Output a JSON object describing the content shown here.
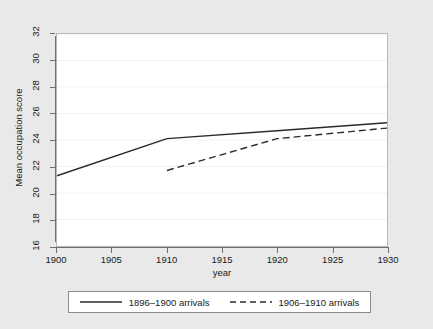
{
  "chart_data": {
    "type": "line",
    "title": "",
    "xlabel": "year",
    "ylabel": "Mean occupation score",
    "xlim": [
      1900,
      1930
    ],
    "ylim": [
      16,
      32
    ],
    "grid": true,
    "legend_position": "bottom",
    "xticks": [
      1900,
      1905,
      1910,
      1915,
      1920,
      1925,
      1930
    ],
    "xtick_labels": [
      "1900",
      "1905",
      "1910",
      "1915",
      "1920",
      "1925",
      "1930"
    ],
    "yticks": [
      16,
      18,
      20,
      22,
      24,
      26,
      28,
      30,
      32
    ],
    "ytick_labels": [
      "16",
      "18",
      "20",
      "22",
      "24",
      "26",
      "28",
      "30",
      "32"
    ],
    "series": [
      {
        "name": "1896–1900 arrivals",
        "style": "solid",
        "color": "#2b2b2b",
        "x": [
          1900,
          1910,
          1920,
          1930
        ],
        "values": [
          21.3,
          24.1,
          24.7,
          25.3
        ]
      },
      {
        "name": "1906–1910 arrivals",
        "style": "dashed",
        "color": "#2b2b2b",
        "x": [
          1910,
          1920,
          1930
        ],
        "values": [
          21.7,
          24.1,
          24.9
        ]
      }
    ]
  },
  "axes": {
    "x_title": "year",
    "y_title": "Mean occupation score"
  },
  "legend": {
    "entries": [
      {
        "label": "1896–1900 arrivals",
        "style": "solid"
      },
      {
        "label": "1906–1910 arrivals",
        "style": "dashed"
      }
    ]
  },
  "colors": {
    "figure_background": "#e9e9e9",
    "plot_background": "#ffffff",
    "axis": "#6f6f6f",
    "gridline": "#f2f2f2",
    "line": "#2b2b2b",
    "text": "#1a1a1a"
  }
}
